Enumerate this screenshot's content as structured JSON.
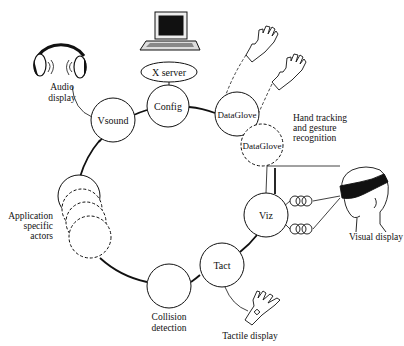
{
  "diagram": {
    "type": "ring-architecture",
    "ring": {
      "cx": 190,
      "cy": 200,
      "r": 100
    },
    "colors": {
      "stroke": "#111111",
      "background": "#ffffff"
    },
    "nodes": [
      {
        "id": "config",
        "label": "Config",
        "cx": 168,
        "cy": 106,
        "r": 21,
        "dashed": false
      },
      {
        "id": "vsound",
        "label": "Vsound",
        "cx": 113,
        "cy": 120,
        "r": 22,
        "dashed": false
      },
      {
        "id": "dataglove1",
        "label": "DataGlove",
        "cx": 237,
        "cy": 114,
        "r": 22,
        "dashed": false
      },
      {
        "id": "dataglove2",
        "label": "DataGlove",
        "cx": 262,
        "cy": 145,
        "r": 21,
        "dashed": true
      },
      {
        "id": "viz",
        "label": "Viz",
        "cx": 266,
        "cy": 215,
        "r": 22,
        "dashed": false
      },
      {
        "id": "tact",
        "label": "Tact",
        "cx": 222,
        "cy": 265,
        "r": 22,
        "dashed": false
      },
      {
        "id": "collision",
        "label": "",
        "cx": 169,
        "cy": 286,
        "r": 22,
        "dashed": false
      },
      {
        "id": "app1",
        "label": "",
        "cx": 79,
        "cy": 198,
        "r": 21,
        "dashed": false
      },
      {
        "id": "app2",
        "label": "",
        "cx": 82,
        "cy": 210,
        "r": 20,
        "dashed": true
      },
      {
        "id": "app3",
        "label": "",
        "cx": 86,
        "cy": 222,
        "r": 20,
        "dashed": true
      },
      {
        "id": "app4",
        "label": "",
        "cx": 90,
        "cy": 237,
        "r": 21,
        "dashed": true
      }
    ],
    "xserver": {
      "label": "X server",
      "cx": 169,
      "cy": 72,
      "rx": 28,
      "ry": 10
    },
    "annotations": {
      "audio_display": [
        "Audio",
        "display"
      ],
      "hand_tracking": [
        "Hand tracking",
        "and gesture",
        "recognition"
      ],
      "application_actors": [
        "Application",
        "specific",
        "actors"
      ],
      "collision_detection": [
        "Collision",
        "detection"
      ],
      "visual_display": "Visual display",
      "tactile_display": "Tactile display"
    },
    "icons": [
      "headphones-icon",
      "laptop-icon",
      "glove-icon",
      "glove-icon",
      "head-mounted-display-icon",
      "fiber-coil-icon",
      "tactile-glove-icon"
    ]
  }
}
